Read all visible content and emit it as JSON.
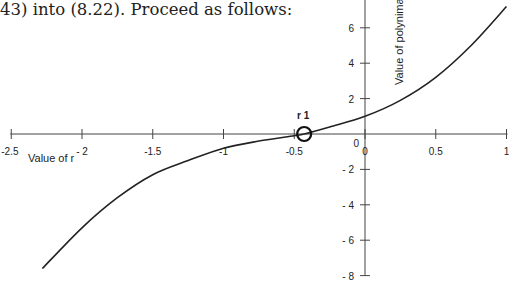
{
  "caption": "43) into (8.22). Proceed as follows:",
  "chart_data": {
    "type": "line",
    "title": "",
    "xlabel": "Value of r",
    "ylabel": "Value of polynimal",
    "xlim": [
      -2.5,
      1
    ],
    "ylim": [
      -8,
      7
    ],
    "grid": false,
    "x_tick_labels": [
      "-2.5",
      "- 2",
      "-1.5",
      "-1",
      "-0.5",
      "0",
      "0.5",
      "1"
    ],
    "y_tick_labels": [
      "6",
      "4",
      "2",
      "0",
      "- 2",
      "- 4",
      "- 6",
      "- 8"
    ],
    "annotations": [
      {
        "label": "r 1",
        "x": -0.43,
        "y": 0,
        "marker": "open-circle"
      }
    ],
    "series": [
      {
        "name": "polynomial",
        "x": [
          -2.28,
          -2.0,
          -1.75,
          -1.5,
          -1.25,
          -1.0,
          -0.75,
          -0.5,
          -0.43,
          -0.25,
          0.0,
          0.25,
          0.5,
          0.75,
          1.0
        ],
        "y": [
          -7.6,
          -5.3,
          -3.6,
          -2.3,
          -1.5,
          -0.8,
          -0.4,
          -0.1,
          0.0,
          0.4,
          1.0,
          1.9,
          3.2,
          5.0,
          7.2
        ]
      }
    ]
  }
}
